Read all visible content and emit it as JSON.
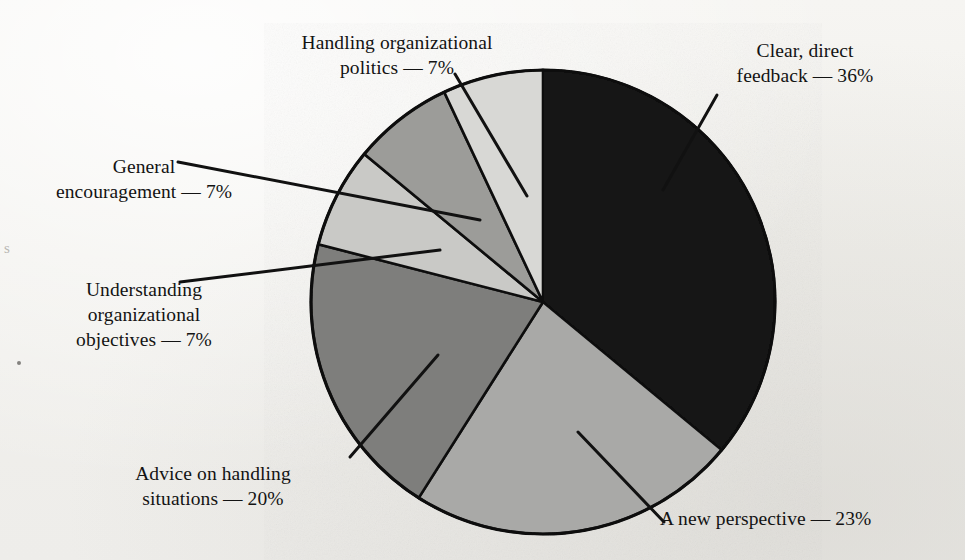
{
  "figure": {
    "kind": "pie-chart",
    "background_color": "#f2f1ed",
    "outline_color": "#111111"
  },
  "labels": {
    "politics": "Handling organizational\npolitics — 7%",
    "feedback": "Clear, direct\nfeedback — 36%",
    "general": "General\nencouragement — 7%",
    "understanding": "Understanding\norganizational\nobjectives — 7%",
    "advice": "Advice on handling\nsituations — 20%",
    "perspective": "A new perspective — 23%"
  },
  "artifacts": {
    "edge_letter": "s"
  },
  "chart_data": {
    "type": "pie",
    "title": "",
    "categories": [
      "Clear, direct feedback",
      "A new perspective",
      "Advice on handling situations",
      "Understanding organizational objectives",
      "General encouragement",
      "Handling organizational politics"
    ],
    "values": [
      36,
      23,
      20,
      7,
      7,
      7
    ],
    "value_labels": [
      "36%",
      "23%",
      "20%",
      "7%",
      "7%",
      "7%"
    ],
    "colors": [
      "#161616",
      "#a9a9a7",
      "#7e7e7c",
      "#c9c9c6",
      "#9c9c99",
      "#d8d8d5"
    ],
    "unit": "%",
    "start_angle_deg": 0,
    "direction": "clockwise",
    "legend": "none",
    "grid": false,
    "labels_placement": "outside-with-leader-lines"
  }
}
